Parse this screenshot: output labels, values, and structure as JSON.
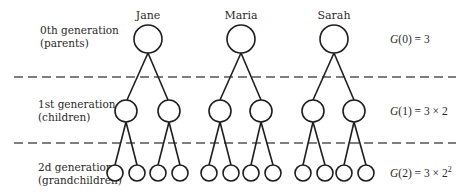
{
  "generations": [
    {
      "title": "0th generation",
      "subtitle": "(parents)",
      "formula_fn": "G",
      "formula_arg": "(0) = 3",
      "formula_sup": ""
    },
    {
      "title": "1st generation",
      "subtitle": "(children)",
      "formula_fn": "G",
      "formula_arg": "(1) = 3 × 2",
      "formula_sup": ""
    },
    {
      "title": "2d generation",
      "subtitle": "(grandchildren)",
      "formula_fn": "G",
      "formula_arg": "(2) = 3 × 2",
      "formula_sup": "2"
    }
  ],
  "parents": [
    {
      "name": "Jane"
    },
    {
      "name": "Maria"
    },
    {
      "name": "Sarah"
    }
  ],
  "tree": {
    "branching_factor": 2,
    "parent_count": 3,
    "children_count": 6,
    "grandchildren_count": 12
  },
  "colors": {
    "stroke": "#1e1e1e",
    "divider": "#555555",
    "text": "#2a2a2a",
    "background": "#ffffff"
  }
}
